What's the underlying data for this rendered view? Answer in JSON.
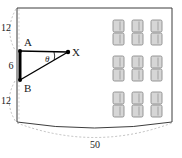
{
  "diagram": {
    "colors": {
      "outline": "#3d3d3d",
      "dimension_line": "#b0b0b0",
      "label_text": "#1a1a1a",
      "desk_fill": "#d6d6d6",
      "desk_stroke": "#8c8c8c",
      "segment": "#000000"
    },
    "room": {
      "name": "room-outline",
      "shape": "rectangle-with-curved-bottom"
    },
    "dimensions": [
      {
        "id": "top-left-vertical",
        "value": "12",
        "orientation": "vertical",
        "side": "left-upper"
      },
      {
        "id": "screen-height",
        "value": "6",
        "orientation": "vertical",
        "side": "left-middle"
      },
      {
        "id": "bottom-left-vertical",
        "value": "12",
        "orientation": "vertical",
        "side": "left-lower"
      },
      {
        "id": "room-width",
        "value": "50",
        "orientation": "horizontal",
        "side": "bottom"
      }
    ],
    "points": [
      {
        "id": "A",
        "label": "A",
        "x": 20,
        "y": 51
      },
      {
        "id": "B",
        "label": "B",
        "x": 20,
        "y": 80
      },
      {
        "id": "X",
        "label": "X",
        "x": 68,
        "y": 52
      }
    ],
    "angle": {
      "id": "theta",
      "label": "θ",
      "vertex": "X"
    },
    "segments": [
      {
        "id": "AB",
        "from": "A",
        "to": "B",
        "style": "thick"
      },
      {
        "id": "AX",
        "from": "A",
        "to": "X",
        "style": "thin"
      },
      {
        "id": "BX",
        "from": "B",
        "to": "X",
        "style": "thin"
      }
    ],
    "seating": {
      "name": "desk-grid",
      "rows": 3,
      "cols": 3,
      "units_per_cell": 2,
      "total_desks": 18
    }
  }
}
